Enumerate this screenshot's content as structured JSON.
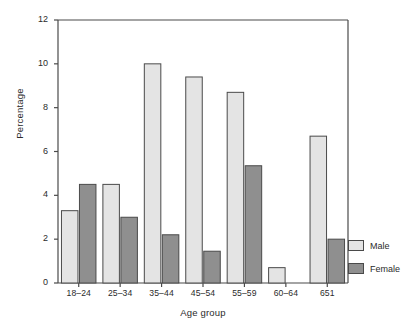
{
  "chart_data": {
    "type": "bar",
    "title": "",
    "subtitle": "",
    "xlabel": "Age group",
    "ylabel": "Percentage",
    "categories": [
      "18–24",
      "25–34",
      "35–44",
      "45–54",
      "55–59",
      "60–64",
      "651"
    ],
    "series": [
      {
        "name": "Male",
        "values": [
          3.3,
          4.5,
          10.0,
          9.4,
          8.7,
          0.7,
          6.7
        ],
        "color": "#e4e4e4"
      },
      {
        "name": "Female",
        "values": [
          4.5,
          3.0,
          2.2,
          1.45,
          5.35,
          0.0,
          2.0
        ],
        "color": "#8f8f8f"
      }
    ],
    "ylim": [
      0,
      12
    ],
    "yticks": [
      0,
      2,
      4,
      6,
      8,
      10,
      12
    ],
    "ytick_labels": [
      "0",
      "2",
      "4",
      "6",
      "8",
      "10",
      "12"
    ],
    "grid": false,
    "legend_position": "right",
    "legend_entries": [
      "Male",
      "Female"
    ],
    "axis_color": "#4a4a4a",
    "bar_edge_color": "#4a4a4a"
  }
}
